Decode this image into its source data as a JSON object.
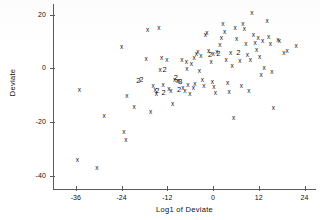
{
  "chart_data": {
    "type": "scatter",
    "title": "",
    "xlabel": "Log1 of Deviate",
    "ylabel": "Deviate",
    "xlim": [
      -42,
      27
    ],
    "ylim": [
      -45,
      24
    ],
    "grid": false,
    "legend": null,
    "xticks": [
      -36,
      -24,
      -12,
      0,
      12,
      24
    ],
    "yticks": [
      20,
      0,
      -20,
      -40
    ],
    "xticklabels": [
      "-36",
      "-24",
      "-12",
      "0",
      "12",
      "24"
    ],
    "yticklabels": [
      "20",
      "0",
      "-20",
      "-40"
    ],
    "marker_symbol": "x",
    "overlap_symbol": "2",
    "overlap_note": "Digit markers denote that many coincident observations",
    "points": [
      {
        "x": -35.6,
        "y": -34.2,
        "m": "x"
      },
      {
        "x": -35.1,
        "y": -8.2,
        "m": "x"
      },
      {
        "x": -30.5,
        "y": -37.3,
        "m": "x"
      },
      {
        "x": -28.6,
        "y": -17.6,
        "m": "x"
      },
      {
        "x": -24.0,
        "y": 7.8,
        "m": "x"
      },
      {
        "x": -23.4,
        "y": -23.8,
        "m": "x"
      },
      {
        "x": -22.9,
        "y": -26.7,
        "m": "x"
      },
      {
        "x": -22.6,
        "y": -10.4,
        "m": "x"
      },
      {
        "x": -20.7,
        "y": -14.6,
        "m": "x"
      },
      {
        "x": -18.8,
        "y": -4.4,
        "m": "2"
      },
      {
        "x": -17.6,
        "y": 3.6,
        "m": "x"
      },
      {
        "x": -17.2,
        "y": 14.4,
        "m": "x"
      },
      {
        "x": -16.4,
        "y": -16.3,
        "m": "x"
      },
      {
        "x": -15.7,
        "y": -6.6,
        "m": "x"
      },
      {
        "x": -15.2,
        "y": -7.9,
        "m": "x"
      },
      {
        "x": -14.9,
        "y": -9.6,
        "m": "x"
      },
      {
        "x": -14.6,
        "y": -8.4,
        "m": "2"
      },
      {
        "x": -14.2,
        "y": 15.0,
        "m": "x"
      },
      {
        "x": -13.9,
        "y": -0.6,
        "m": "x"
      },
      {
        "x": -13.5,
        "y": 4.0,
        "m": "x"
      },
      {
        "x": -13.1,
        "y": -6.2,
        "m": "x"
      },
      {
        "x": -12.7,
        "y": -0.8,
        "m": "2"
      },
      {
        "x": -12.1,
        "y": 3.0,
        "m": "x"
      },
      {
        "x": -11.6,
        "y": -7.6,
        "m": "x"
      },
      {
        "x": -11.1,
        "y": -8.6,
        "m": "x"
      },
      {
        "x": -10.6,
        "y": -13.3,
        "m": "x"
      },
      {
        "x": -10.1,
        "y": -4.2,
        "m": "x"
      },
      {
        "x": -9.8,
        "y": -3.6,
        "m": "2"
      },
      {
        "x": -9.4,
        "y": -4.7,
        "m": "x"
      },
      {
        "x": -9.0,
        "y": -4.9,
        "m": "x"
      },
      {
        "x": -8.6,
        "y": -5.2,
        "m": "3"
      },
      {
        "x": -8.2,
        "y": 3.1,
        "m": "x"
      },
      {
        "x": -7.9,
        "y": -7.3,
        "m": "x"
      },
      {
        "x": -7.4,
        "y": -8.3,
        "m": "x"
      },
      {
        "x": -7.0,
        "y": 2.3,
        "m": "x"
      },
      {
        "x": -6.6,
        "y": -6.1,
        "m": "x"
      },
      {
        "x": -6.1,
        "y": -9.4,
        "m": "x"
      },
      {
        "x": -5.7,
        "y": 1.8,
        "m": "x"
      },
      {
        "x": -5.2,
        "y": -7.2,
        "m": "x"
      },
      {
        "x": -4.8,
        "y": -5.8,
        "m": "x"
      },
      {
        "x": -4.4,
        "y": 5.5,
        "m": "x"
      },
      {
        "x": -4.0,
        "y": 6.1,
        "m": "x"
      },
      {
        "x": -3.6,
        "y": -0.9,
        "m": "x"
      },
      {
        "x": -3.2,
        "y": 4.6,
        "m": "x"
      },
      {
        "x": -2.8,
        "y": -4.3,
        "m": "x"
      },
      {
        "x": -2.4,
        "y": -6.6,
        "m": "x"
      },
      {
        "x": -2.0,
        "y": 12.6,
        "m": "x"
      },
      {
        "x": -1.6,
        "y": 13.0,
        "m": "x"
      },
      {
        "x": -1.2,
        "y": 6.4,
        "m": "x"
      },
      {
        "x": -0.8,
        "y": 5.1,
        "m": "2"
      },
      {
        "x": -0.5,
        "y": 2.4,
        "m": "x"
      },
      {
        "x": -0.2,
        "y": -5.0,
        "m": "x"
      },
      {
        "x": 0.2,
        "y": -6.8,
        "m": "x"
      },
      {
        "x": 0.6,
        "y": -9.2,
        "m": "x"
      },
      {
        "x": 1.0,
        "y": 6.2,
        "m": "x"
      },
      {
        "x": 1.4,
        "y": 5.4,
        "m": "2"
      },
      {
        "x": 1.8,
        "y": 8.8,
        "m": "x"
      },
      {
        "x": 2.2,
        "y": 11.2,
        "m": "x"
      },
      {
        "x": 2.6,
        "y": 16.4,
        "m": "x"
      },
      {
        "x": 3.0,
        "y": 13.4,
        "m": "x"
      },
      {
        "x": 3.4,
        "y": 3.3,
        "m": "x"
      },
      {
        "x": 3.8,
        "y": -5.6,
        "m": "x"
      },
      {
        "x": 4.2,
        "y": -9.0,
        "m": "x"
      },
      {
        "x": 4.6,
        "y": 5.7,
        "m": "x"
      },
      {
        "x": 5.0,
        "y": 0.8,
        "m": "x"
      },
      {
        "x": 5.4,
        "y": -18.6,
        "m": "x"
      },
      {
        "x": 5.8,
        "y": 14.9,
        "m": "x"
      },
      {
        "x": 6.2,
        "y": 11.0,
        "m": "x"
      },
      {
        "x": 6.6,
        "y": 5.8,
        "m": "2"
      },
      {
        "x": 7.0,
        "y": 2.9,
        "m": "x"
      },
      {
        "x": 7.4,
        "y": -6.4,
        "m": "x"
      },
      {
        "x": 7.8,
        "y": 16.5,
        "m": "x"
      },
      {
        "x": 8.2,
        "y": 14.5,
        "m": "x"
      },
      {
        "x": 8.6,
        "y": 9.0,
        "m": "x"
      },
      {
        "x": 9.0,
        "y": 4.8,
        "m": "x"
      },
      {
        "x": 9.4,
        "y": -8.6,
        "m": "x"
      },
      {
        "x": 9.8,
        "y": 3.0,
        "m": "x"
      },
      {
        "x": 10.2,
        "y": 20.8,
        "m": "x"
      },
      {
        "x": 10.6,
        "y": 12.4,
        "m": "x"
      },
      {
        "x": 11.0,
        "y": 9.6,
        "m": "x"
      },
      {
        "x": 11.4,
        "y": 6.9,
        "m": "x"
      },
      {
        "x": 11.8,
        "y": 11.5,
        "m": "x"
      },
      {
        "x": 12.2,
        "y": 4.1,
        "m": "x"
      },
      {
        "x": 12.6,
        "y": -2.5,
        "m": "x"
      },
      {
        "x": 13.0,
        "y": 10.3,
        "m": "x"
      },
      {
        "x": 13.4,
        "y": 0.0,
        "m": "x"
      },
      {
        "x": 14.2,
        "y": 17.7,
        "m": "x"
      },
      {
        "x": 14.6,
        "y": 11.8,
        "m": "x"
      },
      {
        "x": 15.0,
        "y": 9.2,
        "m": "x"
      },
      {
        "x": 15.4,
        "y": -1.4,
        "m": "x"
      },
      {
        "x": 15.8,
        "y": -14.8,
        "m": "x"
      },
      {
        "x": 17.0,
        "y": 10.5,
        "m": "x"
      },
      {
        "x": 17.4,
        "y": 10.1,
        "m": "x"
      },
      {
        "x": 18.6,
        "y": 5.6,
        "m": "x"
      },
      {
        "x": 19.4,
        "y": 6.3,
        "m": "x"
      },
      {
        "x": 21.8,
        "y": 8.2,
        "m": "x"
      },
      {
        "x": -19.6,
        "y": -4.6,
        "m": "2"
      },
      {
        "x": -13.0,
        "y": -9.1,
        "m": "2"
      },
      {
        "x": -8.9,
        "y": -8.0,
        "m": "2"
      },
      {
        "x": 0.0,
        "y": 5.2,
        "m": "x"
      },
      {
        "x": -6.9,
        "y": -0.4,
        "m": "x"
      },
      {
        "x": -5.0,
        "y": 3.8,
        "m": "x"
      }
    ]
  }
}
